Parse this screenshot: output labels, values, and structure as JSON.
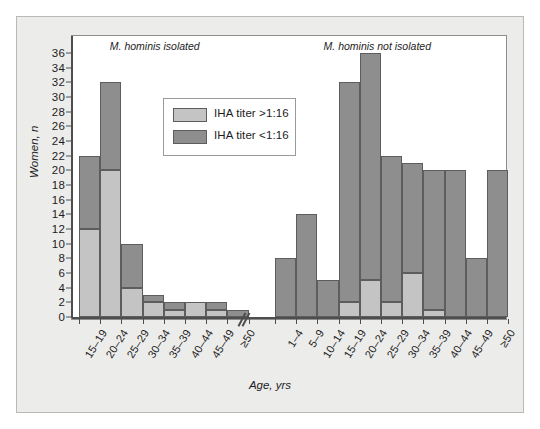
{
  "figure": {
    "y_axis_title": "Women, n",
    "x_axis_title": "Age, yrs",
    "group_left_caption": "M. hominis isolated",
    "group_right_caption": "M. hominis not isolated",
    "axis_break_marker": "axis-break"
  },
  "legend": {
    "entries": [
      {
        "label": "IHA titer >1:16",
        "color": "#c4c4c4",
        "key": "high"
      },
      {
        "label": "IHA titer <1:16",
        "color": "#8e8e8e",
        "key": "low"
      }
    ]
  },
  "chart_data": {
    "type": "bar",
    "title": "",
    "subtitle": "",
    "xlabel": "Age, yrs",
    "ylabel": "Women, n",
    "ylim": [
      0,
      36
    ],
    "ytick_values": [
      0,
      2,
      4,
      6,
      8,
      10,
      12,
      14,
      16,
      18,
      20,
      22,
      24,
      26,
      28,
      30,
      32,
      34,
      36
    ],
    "ytick_labels": [
      "0",
      "2",
      "4",
      "6",
      "8",
      "10",
      "12",
      "14",
      "16",
      "18",
      "20",
      "22",
      "24",
      "26",
      "28",
      "30",
      "32",
      "34",
      "36"
    ],
    "grid": false,
    "stacked": true,
    "legend_position": "inside-upper-left-center",
    "series": [
      {
        "name": "IHA titer >1:16",
        "color": "#c4c4c4"
      },
      {
        "name": "IHA titer <1:16",
        "color": "#8e8e8e"
      }
    ],
    "groups": [
      {
        "name": "M. hominis isolated",
        "categories": [
          "15–19",
          "20–24",
          "25–29",
          "30–34",
          "35–39",
          "40–44",
          "45–49",
          "≥50"
        ],
        "values_high": [
          12,
          20,
          4,
          2,
          1,
          2,
          1,
          0
        ],
        "values_low": [
          10,
          12,
          6,
          1,
          1,
          0,
          1,
          1
        ],
        "totals": [
          22,
          32,
          10,
          3,
          2,
          2,
          2,
          1
        ]
      },
      {
        "name": "M. hominis not isolated",
        "categories": [
          "1–4",
          "5–9",
          "10–14",
          "15–19",
          "20–24",
          "25–29",
          "30–34",
          "35–39",
          "40–44",
          "45–49",
          "≥50"
        ],
        "values_high": [
          0,
          0,
          0,
          2,
          5,
          2,
          6,
          1,
          0,
          0,
          0
        ],
        "values_low": [
          8,
          14,
          5,
          30,
          31,
          20,
          15,
          19,
          20,
          8,
          20
        ],
        "totals": [
          8,
          14,
          5,
          32,
          36,
          22,
          21,
          20,
          20,
          8,
          20
        ]
      }
    ]
  }
}
